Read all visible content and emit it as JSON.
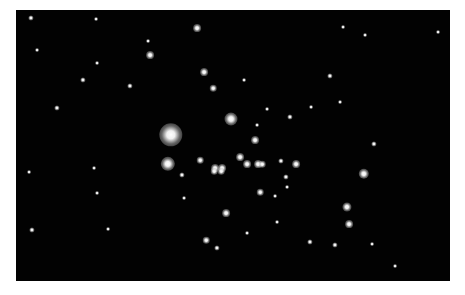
{
  "image": {
    "subject": "open star cluster on black sky",
    "background": "#ffffff",
    "sky_color": "#020202",
    "frame": {
      "left": 16,
      "top": 10,
      "width": 434,
      "height": 271
    },
    "stars": [
      [
        171,
        135,
        9
      ],
      [
        168,
        164,
        5.5
      ],
      [
        231,
        119,
        5
      ],
      [
        197,
        28,
        3
      ],
      [
        150,
        55,
        3
      ],
      [
        204,
        72,
        3
      ],
      [
        364,
        174,
        4
      ],
      [
        347,
        207,
        3.5
      ],
      [
        349,
        224,
        3
      ],
      [
        226,
        213,
        3
      ],
      [
        255,
        140,
        3
      ],
      [
        240,
        157,
        3
      ],
      [
        247,
        164,
        3
      ],
      [
        258,
        164,
        3
      ],
      [
        262,
        164,
        2.5
      ],
      [
        296,
        164,
        3
      ],
      [
        200,
        160,
        2.5
      ],
      [
        215,
        168,
        3
      ],
      [
        222,
        168,
        3
      ],
      [
        214,
        171,
        2.5
      ],
      [
        221,
        171,
        2.5
      ],
      [
        281,
        161,
        2
      ],
      [
        260,
        192,
        2.5
      ],
      [
        213,
        88,
        2.5
      ],
      [
        330,
        76,
        2
      ],
      [
        206,
        240,
        2.5
      ],
      [
        217,
        248,
        2
      ],
      [
        31,
        18,
        2
      ],
      [
        57,
        108,
        2
      ],
      [
        83,
        80,
        2
      ],
      [
        130,
        86,
        2
      ],
      [
        32,
        230,
        2
      ],
      [
        97,
        63,
        1.5
      ],
      [
        37,
        50,
        1.5
      ],
      [
        96,
        19,
        1.5
      ],
      [
        148,
        41,
        1.5
      ],
      [
        244,
        80,
        1.5
      ],
      [
        267,
        109,
        1.5
      ],
      [
        290,
        117,
        2
      ],
      [
        286,
        177,
        2
      ],
      [
        257,
        125,
        1.5
      ],
      [
        182,
        175,
        2
      ],
      [
        287,
        187,
        1.5
      ],
      [
        310,
        242,
        2
      ],
      [
        335,
        245,
        2
      ],
      [
        372,
        244,
        1.5
      ],
      [
        343,
        27,
        1.5
      ],
      [
        365,
        35,
        1.5
      ],
      [
        340,
        102,
        1.5
      ],
      [
        374,
        144,
        2
      ],
      [
        97,
        193,
        1.5
      ],
      [
        108,
        229,
        1.5
      ],
      [
        29,
        172,
        1.5
      ],
      [
        94,
        168,
        1.5
      ],
      [
        277,
        222,
        1.5
      ],
      [
        247,
        233,
        1.5
      ],
      [
        184,
        198,
        1.5
      ],
      [
        438,
        32,
        1.5
      ],
      [
        395,
        266,
        1.5
      ],
      [
        311,
        107,
        1.5
      ],
      [
        275,
        196,
        1.5
      ]
    ]
  }
}
